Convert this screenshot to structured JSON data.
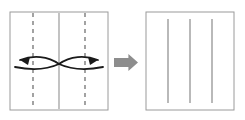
{
  "figure": {
    "background_color": "#ffffff",
    "caption": ""
  },
  "palette": {
    "sheet_border": "#9a9a9a",
    "sheet_fill": "#ffffff",
    "dashed_crease": "#8c8c8c",
    "solid_crease": "#9a9a9a",
    "result_crease": "#8a8a8a",
    "fold_arrow": "#1a1a1a",
    "transition_arrow": "#8d8d8d"
  },
  "before_panel": {
    "label": "before-sheet",
    "description": "Square sheet with two dashed fold lines and one center crease",
    "x": 10,
    "y": 12,
    "width": 98,
    "height": 98,
    "border_width": 1,
    "dashed_creases": [
      {
        "name": "left-dashed-crease",
        "x": 33,
        "y1": 13,
        "y2": 109,
        "dash": "4 4",
        "width": 1.6
      },
      {
        "name": "right-dashed-crease",
        "x": 85,
        "y1": 13,
        "y2": 109,
        "dash": "4 4",
        "width": 1.6
      }
    ],
    "solid_creases": [
      {
        "name": "center-crease",
        "x": 59,
        "y1": 13,
        "y2": 109,
        "width": 1.2
      }
    ]
  },
  "fold_arrows": {
    "label": "fold-motion-arrows",
    "stroke_width": 1.8,
    "left": {
      "name": "left-fold-arrow",
      "upper_curve": "M 59 64 C 48 56 33 55 20 60",
      "lower_curve": "M 59 64 C 46 70 30 70 15 67",
      "head": {
        "points": "20,60 30,57 28,65",
        "angle_deg": 200
      }
    },
    "right": {
      "name": "right-fold-arrow",
      "upper_curve": "M 59 64 C 70 56 85 55 98 60",
      "lower_curve": "M 59 64 C 72 70 88 70 103 67",
      "head": {
        "points": "98,60 88,57 90,65",
        "angle_deg": 340
      }
    }
  },
  "transition_arrow": {
    "name": "transition-arrow",
    "direction": "right",
    "x": 114,
    "y": 54,
    "width": 24,
    "height": 17,
    "color": "#8d8d8d"
  },
  "after_panel": {
    "label": "after-sheet",
    "description": "Square sheet showing three resulting crease lines",
    "x": 146,
    "y": 12,
    "width": 88,
    "height": 98,
    "border_width": 1,
    "creases": [
      {
        "name": "result-crease-1",
        "x": 168,
        "y1": 19,
        "y2": 103,
        "width": 1.2
      },
      {
        "name": "result-crease-2",
        "x": 190,
        "y1": 19,
        "y2": 103,
        "width": 1.2
      },
      {
        "name": "result-crease-3",
        "x": 212,
        "y1": 19,
        "y2": 103,
        "width": 1.2
      }
    ]
  }
}
